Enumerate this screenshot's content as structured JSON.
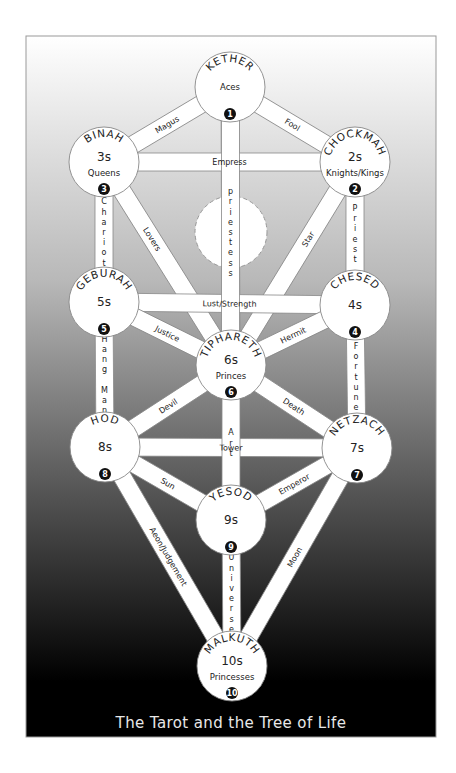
{
  "diagram": {
    "title": "The Tarot and the Tree of Life",
    "frame": {
      "x": 26,
      "y": 36,
      "width": 410,
      "height": 701,
      "gradient_top": "#ffffff",
      "gradient_bottom": "#000000",
      "border": "#999999"
    },
    "node_radius": 35,
    "path_width": 18,
    "daath": {
      "cx": 231,
      "cy": 232,
      "r": 36,
      "style": "dashed"
    },
    "nodes": [
      {
        "id": "kether",
        "name": "KETHER",
        "number": "",
        "suit": "Aces",
        "badge": "1",
        "cx": 230,
        "cy": 87
      },
      {
        "id": "chockmah",
        "name": "CHOCKMAH",
        "number": "2s",
        "suit": "Knights/Kings",
        "badge": "2",
        "cx": 355,
        "cy": 162
      },
      {
        "id": "binah",
        "name": "BINAH",
        "number": "3s",
        "suit": "Queens",
        "badge": "3",
        "cx": 104,
        "cy": 162
      },
      {
        "id": "chesed",
        "name": "CHESED",
        "number": "4s",
        "suit": "",
        "badge": "4",
        "cx": 355,
        "cy": 305
      },
      {
        "id": "geburah",
        "name": "GEBURAH",
        "number": "5s",
        "suit": "",
        "badge": "5",
        "cx": 104,
        "cy": 302
      },
      {
        "id": "tiphareth",
        "name": "TIPHARETH",
        "number": "6s",
        "suit": "Princes",
        "badge": "6",
        "cx": 231,
        "cy": 365
      },
      {
        "id": "netzach",
        "name": "NETZACH",
        "number": "7s",
        "suit": "",
        "badge": "7",
        "cx": 357,
        "cy": 448
      },
      {
        "id": "hod",
        "name": "HOD",
        "number": "8s",
        "suit": "",
        "badge": "8",
        "cx": 105,
        "cy": 447
      },
      {
        "id": "yesod",
        "name": "YESOD",
        "number": "9s",
        "suit": "",
        "badge": "9",
        "cx": 231,
        "cy": 520
      },
      {
        "id": "malkuth",
        "name": "MALKUTH",
        "number": "10s",
        "suit": "Princesses",
        "badge": "10",
        "cx": 232,
        "cy": 666
      }
    ],
    "paths": [
      {
        "label": "Magus",
        "from": "kether",
        "to": "binah",
        "orient": "along"
      },
      {
        "label": "Fool",
        "from": "kether",
        "to": "chockmah",
        "orient": "along"
      },
      {
        "label": "priestess",
        "from": "kether",
        "to": "tiphareth",
        "orient": "vertical-stack",
        "label_cy": 232
      },
      {
        "label": "Empress",
        "from": "binah",
        "to": "chockmah",
        "orient": "along"
      },
      {
        "label": "Chariot",
        "from": "binah",
        "to": "geburah",
        "orient": "vertical-stack"
      },
      {
        "label": "Priest",
        "from": "chockmah",
        "to": "chesed",
        "orient": "vertical-stack"
      },
      {
        "label": "Lovers",
        "from": "binah",
        "to": "tiphareth",
        "orient": "along",
        "label_t": 0.38
      },
      {
        "label": "Star",
        "from": "chockmah",
        "to": "tiphareth",
        "orient": "along",
        "label_t": 0.38
      },
      {
        "label": "Lust/Strength",
        "from": "geburah",
        "to": "chesed",
        "orient": "along"
      },
      {
        "label": "Justice",
        "from": "geburah",
        "to": "tiphareth",
        "orient": "along"
      },
      {
        "label": "Hermit",
        "from": "chesed",
        "to": "tiphareth",
        "orient": "along"
      },
      {
        "label": "Hang Man",
        "from": "geburah",
        "to": "hod",
        "orient": "vertical-stack"
      },
      {
        "label": "Fortune",
        "from": "chesed",
        "to": "netzach",
        "orient": "vertical-stack"
      },
      {
        "label": "Devil",
        "from": "tiphareth",
        "to": "hod",
        "orient": "along"
      },
      {
        "label": "Death",
        "from": "tiphareth",
        "to": "netzach",
        "orient": "along"
      },
      {
        "label": "Tower",
        "from": "hod",
        "to": "netzach",
        "orient": "along"
      },
      {
        "label": "Art",
        "from": "tiphareth",
        "to": "yesod",
        "orient": "vertical-stack"
      },
      {
        "label": "Sun",
        "from": "hod",
        "to": "yesod",
        "orient": "along"
      },
      {
        "label": "Emperor",
        "from": "netzach",
        "to": "yesod",
        "orient": "along"
      },
      {
        "label": "Aeon/Judgement",
        "from": "hod",
        "to": "malkuth",
        "orient": "along"
      },
      {
        "label": "Moon",
        "from": "netzach",
        "to": "malkuth",
        "orient": "along"
      },
      {
        "label": "Universe",
        "from": "yesod",
        "to": "malkuth",
        "orient": "vertical-stack"
      }
    ]
  }
}
